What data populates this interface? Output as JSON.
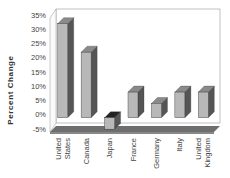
{
  "chart_data": {
    "type": "bar",
    "style": "3d-column",
    "title": "",
    "xlabel": "",
    "ylabel": "Percent   Change",
    "categories": [
      "United States",
      "Canada",
      "Japan",
      "France",
      "Germany",
      "Italy",
      "United Kingdom"
    ],
    "category_lines": [
      [
        "United",
        "States"
      ],
      [
        "Canada"
      ],
      [
        "Japan"
      ],
      [
        "France"
      ],
      [
        "Germany"
      ],
      [
        "Italy"
      ],
      [
        "United",
        "Kingdom"
      ]
    ],
    "values": [
      33,
      23,
      -4,
      9,
      5,
      9,
      9
    ],
    "ylim": [
      -5,
      35
    ],
    "yticks": [
      35,
      30,
      25,
      20,
      15,
      10,
      5,
      0,
      -5
    ],
    "ytick_labels": [
      "35%",
      "30%",
      "25%",
      "20%",
      "15%",
      "10%",
      "5%",
      "0%",
      "-5%"
    ],
    "grid": false,
    "legend": null,
    "colors": {
      "front": "#b8b8b8",
      "side": "#555555",
      "top": "#8a8a8a",
      "floor": "#6e6e6e",
      "wall": "#ffffff",
      "wall_edge": "#999999"
    }
  }
}
